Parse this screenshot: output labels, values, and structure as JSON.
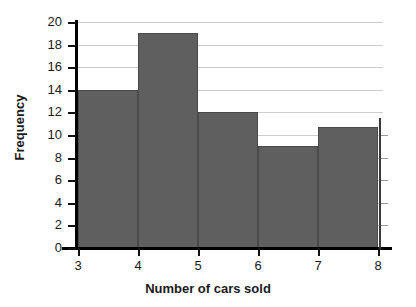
{
  "chart_data": {
    "type": "bar",
    "title": "",
    "subtitle": "",
    "xlabel": "Number of cars sold",
    "ylabel": "Frequency",
    "categories": [
      "3-4",
      "4-5",
      "5-6",
      "6-7",
      "7-8"
    ],
    "bin_edges": [
      3,
      4,
      5,
      6,
      7,
      8
    ],
    "values": [
      14,
      19,
      12,
      9,
      10.7
    ],
    "xlim": [
      3,
      8
    ],
    "ylim": [
      0,
      20
    ],
    "xticks": [
      3,
      4,
      5,
      6,
      7,
      8
    ],
    "xtick_labels": [
      "3",
      "4",
      "5",
      "6",
      "7",
      "8"
    ],
    "yticks": [
      0,
      2,
      4,
      6,
      8,
      10,
      12,
      14,
      16,
      18,
      20
    ],
    "ytick_labels": [
      "0",
      "2",
      "4",
      "6",
      "8",
      "10",
      "12",
      "14",
      "16",
      "18",
      "20"
    ],
    "grid": true,
    "grid_axis": "y",
    "legend": false,
    "bar_color": "#605f5f",
    "bar_edge_color": "#4a4a4a",
    "grid_color": "#cccccc",
    "axis_color": "#000000",
    "background_color": "#ffffff"
  }
}
